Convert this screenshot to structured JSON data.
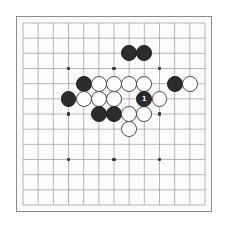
{
  "board": {
    "game": "go",
    "size": 13,
    "background_color": "#fcfcfc",
    "page_background_color": "#ffffff",
    "border_color": "#8a8a8a",
    "line_color": "#9a9a9a",
    "star_point_color": "#3a3a3a",
    "black_stone_color": "#2b2b2b",
    "white_stone_color": "#fdfdfd",
    "white_stone_outline_color": "#4a4a4a",
    "star_points": [
      {
        "col": 3,
        "row": 3
      },
      {
        "col": 6,
        "row": 3
      },
      {
        "col": 9,
        "row": 3
      },
      {
        "col": 3,
        "row": 6
      },
      {
        "col": 6,
        "row": 6
      },
      {
        "col": 9,
        "row": 6
      },
      {
        "col": 3,
        "row": 9
      },
      {
        "col": 6,
        "row": 9
      },
      {
        "col": 9,
        "row": 9
      }
    ],
    "stones": [
      {
        "col": 7,
        "row": 2,
        "color": "black",
        "label": ""
      },
      {
        "col": 8,
        "row": 2,
        "color": "black",
        "label": ""
      },
      {
        "col": 4,
        "row": 4,
        "color": "black",
        "label": ""
      },
      {
        "col": 5,
        "row": 4,
        "color": "white",
        "label": ""
      },
      {
        "col": 6,
        "row": 4,
        "color": "white",
        "label": ""
      },
      {
        "col": 7,
        "row": 4,
        "color": "white",
        "label": ""
      },
      {
        "col": 8,
        "row": 4,
        "color": "white",
        "label": ""
      },
      {
        "col": 10,
        "row": 4,
        "color": "black",
        "label": ""
      },
      {
        "col": 11,
        "row": 4,
        "color": "white",
        "label": ""
      },
      {
        "col": 3,
        "row": 5,
        "color": "black",
        "label": ""
      },
      {
        "col": 4,
        "row": 5,
        "color": "white",
        "label": ""
      },
      {
        "col": 5,
        "row": 5,
        "color": "white",
        "label": ""
      },
      {
        "col": 6,
        "row": 5,
        "color": "white",
        "label": ""
      },
      {
        "col": 8,
        "row": 5,
        "color": "black",
        "label": "1"
      },
      {
        "col": 9,
        "row": 5,
        "color": "white",
        "label": ""
      },
      {
        "col": 5,
        "row": 6,
        "color": "black",
        "label": ""
      },
      {
        "col": 6,
        "row": 6,
        "color": "black",
        "label": ""
      },
      {
        "col": 7,
        "row": 6,
        "color": "white",
        "label": ""
      },
      {
        "col": 8,
        "row": 6,
        "color": "white",
        "label": ""
      },
      {
        "col": 7,
        "row": 7,
        "color": "white",
        "label": ""
      }
    ],
    "last_move": {
      "col": 8,
      "row": 5,
      "color": "black",
      "number": "1"
    }
  }
}
